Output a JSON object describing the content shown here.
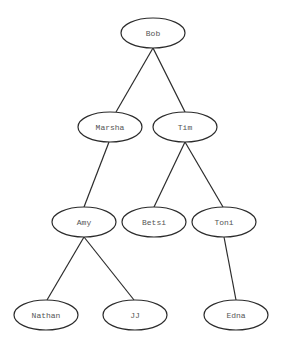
{
  "diagram": {
    "type": "tree",
    "node_style": {
      "shape": "ellipse",
      "rx": 32,
      "ry": 15,
      "stroke_color": "#2b2b2b",
      "fill_color": "#ffffff",
      "text_color": "#555555"
    },
    "nodes": [
      {
        "id": "bob",
        "label": "Bob",
        "cx": 153,
        "cy": 33
      },
      {
        "id": "marsha",
        "label": "Marsha",
        "cx": 110,
        "cy": 127
      },
      {
        "id": "tim",
        "label": "Tim",
        "cx": 185,
        "cy": 127
      },
      {
        "id": "amy",
        "label": "Amy",
        "cx": 84,
        "cy": 222
      },
      {
        "id": "betsi",
        "label": "Betsi",
        "cx": 154,
        "cy": 222
      },
      {
        "id": "toni",
        "label": "Toni",
        "cx": 224,
        "cy": 222
      },
      {
        "id": "nathan",
        "label": "Nathan",
        "cx": 46,
        "cy": 315
      },
      {
        "id": "jj",
        "label": "JJ",
        "cx": 135,
        "cy": 315
      },
      {
        "id": "edna",
        "label": "Edna",
        "cx": 236,
        "cy": 315
      }
    ],
    "edges": [
      {
        "from": "bob",
        "to": "marsha",
        "x1": 153,
        "y1": 48,
        "x2": 116,
        "y2": 112
      },
      {
        "from": "bob",
        "to": "tim",
        "x1": 153,
        "y1": 48,
        "x2": 185,
        "y2": 112
      },
      {
        "from": "marsha",
        "to": "amy",
        "x1": 109,
        "y1": 142,
        "x2": 84,
        "y2": 207
      },
      {
        "from": "tim",
        "to": "betsi",
        "x1": 185,
        "y1": 142,
        "x2": 154,
        "y2": 207
      },
      {
        "from": "tim",
        "to": "toni",
        "x1": 185,
        "y1": 142,
        "x2": 223,
        "y2": 207
      },
      {
        "from": "amy",
        "to": "nathan",
        "x1": 84,
        "y1": 237,
        "x2": 47,
        "y2": 300
      },
      {
        "from": "amy",
        "to": "jj",
        "x1": 84,
        "y1": 237,
        "x2": 134,
        "y2": 300
      },
      {
        "from": "toni",
        "to": "edna",
        "x1": 224,
        "y1": 237,
        "x2": 236,
        "y2": 300
      }
    ]
  }
}
